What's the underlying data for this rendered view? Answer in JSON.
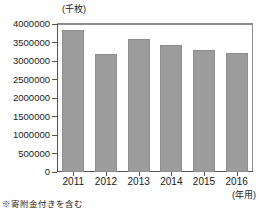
{
  "chart_data": {
    "type": "bar",
    "title": "",
    "subtitle": "",
    "categories": [
      "2011",
      "2012",
      "2013",
      "2014",
      "2015",
      "2016"
    ],
    "values": [
      3830000,
      3200000,
      3590000,
      3430000,
      3310000,
      3220000
    ],
    "series": [
      {
        "name": "年賀葉書発行枚数",
        "values": [
          3830000,
          3200000,
          3590000,
          3430000,
          3310000,
          3220000
        ]
      }
    ],
    "xlabel": "(年用)",
    "ylabel": "(千枚)",
    "ylim": [
      0,
      4000000
    ],
    "ytick_labels": [
      "0",
      "500000",
      "1000000",
      "1500000",
      "2000000",
      "2500000",
      "3000000",
      "3500000",
      "4000000"
    ],
    "ytick_values": [
      0,
      500000,
      1000000,
      1500000,
      2000000,
      2500000,
      3000000,
      3500000,
      4000000
    ],
    "grid": false,
    "legend": false,
    "legend_position": "none",
    "bar_color": "#9c9c9c",
    "axis_color": "#555555",
    "annotations": [
      "※寄附金付きを含む"
    ]
  },
  "axis": {
    "y_unit": "(千枚)",
    "x_unit": "(年用)"
  },
  "footnote": {
    "text": "※寄附金付きを含む"
  }
}
